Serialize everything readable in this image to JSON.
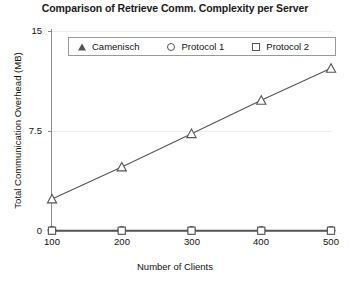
{
  "chart_data": {
    "type": "line",
    "title": "Comparison of Retrieve Comm. Complexity per Server",
    "xlabel": "Number of Clients",
    "ylabel": "Total Communication Overhead (MB)",
    "categories": [
      100,
      200,
      300,
      400,
      500
    ],
    "x": [
      100,
      200,
      300,
      400,
      500
    ],
    "xtick_labels": [
      "100",
      "200",
      "300",
      "400",
      "500"
    ],
    "ytick_labels": [
      "0",
      "7.5",
      "15"
    ],
    "yticks": [
      0,
      7.5,
      15
    ],
    "xlim": [
      100,
      500
    ],
    "ylim": [
      0,
      15
    ],
    "grid": true,
    "legend_position": "top-center-inside",
    "series": [
      {
        "name": "Camenisch",
        "marker": "triangle",
        "color": "#555555",
        "values": [
          2.4,
          4.8,
          7.3,
          9.8,
          12.2
        ]
      },
      {
        "name": "Protocol 1",
        "marker": "circle",
        "color": "#555555",
        "values": [
          0.05,
          0.05,
          0.05,
          0.05,
          0.05
        ]
      },
      {
        "name": "Protocol 2",
        "marker": "square",
        "color": "#555555",
        "values": [
          0.02,
          0.02,
          0.02,
          0.02,
          0.02
        ]
      }
    ]
  },
  "legend": {
    "entries": [
      {
        "label": "Camenisch",
        "marker": "triangle-icon"
      },
      {
        "label": "Protocol 1",
        "marker": "circle-icon"
      },
      {
        "label": "Protocol 2",
        "marker": "square-icon"
      }
    ]
  }
}
